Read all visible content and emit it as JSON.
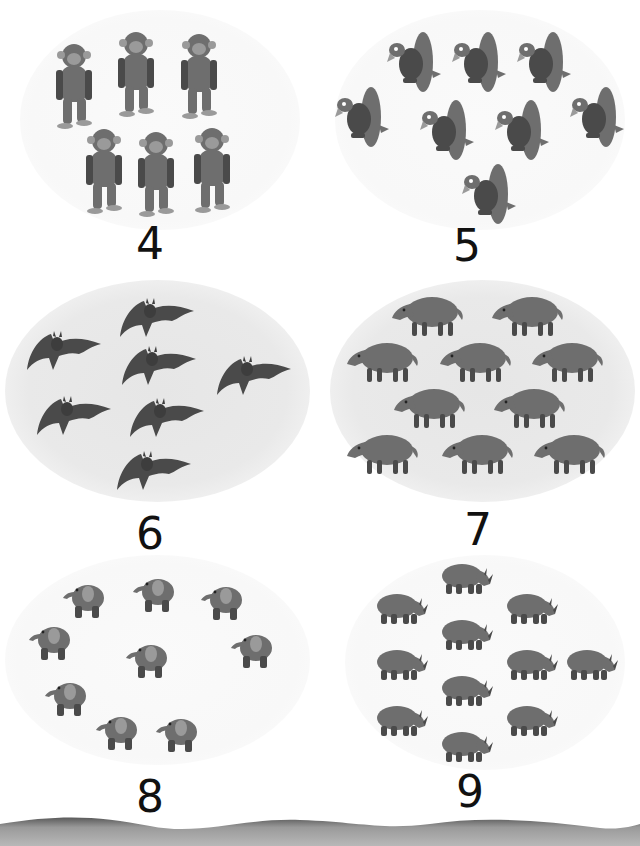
{
  "page": {
    "background": "#ffffff"
  },
  "panels": [
    {
      "animal": "chimpanzee",
      "count_shown": 6,
      "numeral": "4",
      "background": "none",
      "positions": [
        [
          50,
          40
        ],
        [
          112,
          28
        ],
        [
          175,
          30
        ],
        [
          80,
          125
        ],
        [
          132,
          128
        ],
        [
          188,
          124
        ]
      ]
    },
    {
      "animal": "vulture",
      "count_shown": 8,
      "numeral": "5",
      "background": "none",
      "positions": [
        [
          385,
          30
        ],
        [
          450,
          30
        ],
        [
          515,
          30
        ],
        [
          333,
          85
        ],
        [
          418,
          98
        ],
        [
          493,
          98
        ],
        [
          568,
          85
        ],
        [
          460,
          162
        ]
      ]
    },
    {
      "animal": "bat",
      "count_shown": 7,
      "numeral": "6",
      "background": "ellipse",
      "positions": [
        [
          25,
          330
        ],
        [
          118,
          297
        ],
        [
          120,
          345
        ],
        [
          215,
          355
        ],
        [
          35,
          395
        ],
        [
          128,
          397
        ],
        [
          115,
          450
        ]
      ]
    },
    {
      "animal": "boar",
      "count_shown": 10,
      "numeral": "7",
      "background": "ellipse",
      "positions": [
        [
          390,
          292
        ],
        [
          490,
          292
        ],
        [
          345,
          338
        ],
        [
          438,
          338
        ],
        [
          530,
          338
        ],
        [
          392,
          384
        ],
        [
          492,
          384
        ],
        [
          345,
          430
        ],
        [
          440,
          430
        ],
        [
          532,
          430
        ]
      ]
    },
    {
      "animal": "elephant",
      "count_shown": 9,
      "numeral": "8",
      "background": "faint-ellipse",
      "positions": [
        [
          62,
          578
        ],
        [
          132,
          572
        ],
        [
          200,
          580
        ],
        [
          28,
          620
        ],
        [
          125,
          638
        ],
        [
          230,
          628
        ],
        [
          44,
          676
        ],
        [
          95,
          710
        ],
        [
          155,
          712
        ]
      ]
    },
    {
      "animal": "rhinoceros",
      "count_shown": 11,
      "numeral": "9",
      "background": "faint-ellipse",
      "positions": [
        [
          440,
          560
        ],
        [
          375,
          590
        ],
        [
          505,
          590
        ],
        [
          440,
          616
        ],
        [
          375,
          646
        ],
        [
          505,
          646
        ],
        [
          565,
          646
        ],
        [
          440,
          672
        ],
        [
          375,
          702
        ],
        [
          505,
          702
        ],
        [
          440,
          728
        ]
      ]
    }
  ],
  "colors": {
    "animal_fill": "#6e6e6e",
    "animal_dark": "#4a4a4a",
    "animal_light": "#9a9a9a",
    "ellipse": "#e8e8e8",
    "numeral": "#111111",
    "band": "#9c9c9c"
  }
}
